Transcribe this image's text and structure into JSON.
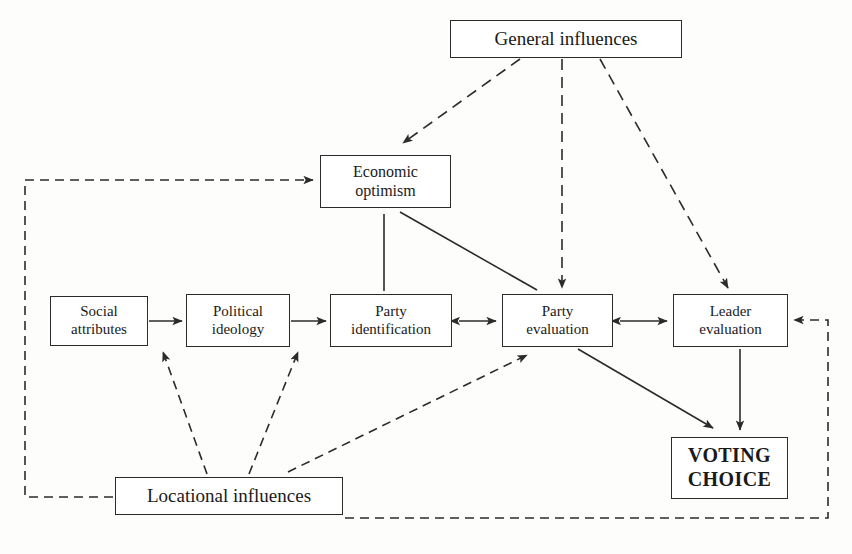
{
  "diagram": {
    "nodes": {
      "general_influences": {
        "label": "General influences",
        "lines": [
          "General influences"
        ]
      },
      "economic_optimism": {
        "label": "Economic optimism",
        "lines": [
          "Economic",
          "optimism"
        ]
      },
      "social_attributes": {
        "label": "Social attributes",
        "lines": [
          "Social",
          "attributes"
        ]
      },
      "political_ideology": {
        "label": "Political ideology",
        "lines": [
          "Political",
          "ideology"
        ]
      },
      "party_identification": {
        "label": "Party identification",
        "lines": [
          "Party",
          "identification"
        ]
      },
      "party_evaluation": {
        "label": "Party evaluation",
        "lines": [
          "Party",
          "evaluation"
        ]
      },
      "leader_evaluation": {
        "label": "Leader evaluation",
        "lines": [
          "Leader",
          "evaluation"
        ]
      },
      "voting_choice": {
        "label": "VOTING CHOICE",
        "lines": [
          "VOTING",
          "CHOICE"
        ]
      },
      "locational_influences": {
        "label": "Locational influences",
        "lines": [
          "Locational influences"
        ]
      }
    },
    "edges": [
      {
        "id": "gen-to-econ",
        "from": "general_influences",
        "to": "economic_optimism",
        "style": "dashed",
        "arrows": "single"
      },
      {
        "id": "gen-to-partyeval",
        "from": "general_influences",
        "to": "party_evaluation",
        "style": "dashed",
        "arrows": "single"
      },
      {
        "id": "gen-to-leadereval",
        "from": "general_influences",
        "to": "leader_evaluation",
        "style": "dashed",
        "arrows": "single"
      },
      {
        "id": "econ-to-partyeval",
        "from": "economic_optimism",
        "to": "party_evaluation",
        "style": "solid",
        "arrows": "single"
      },
      {
        "id": "partyid-to-econ",
        "from": "party_identification",
        "to": "economic_optimism",
        "style": "solid",
        "arrows": "single"
      },
      {
        "id": "social-to-ideology",
        "from": "social_attributes",
        "to": "political_ideology",
        "style": "solid",
        "arrows": "single"
      },
      {
        "id": "ideology-to-partyid",
        "from": "political_ideology",
        "to": "party_identification",
        "style": "solid",
        "arrows": "single"
      },
      {
        "id": "partyid-partyeval",
        "from": "party_identification",
        "to": "party_evaluation",
        "style": "solid",
        "arrows": "double"
      },
      {
        "id": "partyeval-leadereval",
        "from": "party_evaluation",
        "to": "leader_evaluation",
        "style": "solid",
        "arrows": "double"
      },
      {
        "id": "partyeval-to-voting",
        "from": "party_evaluation",
        "to": "voting_choice",
        "style": "solid",
        "arrows": "single"
      },
      {
        "id": "leadereval-to-voting",
        "from": "leader_evaluation",
        "to": "voting_choice",
        "style": "solid",
        "arrows": "single"
      },
      {
        "id": "loc-to-social",
        "from": "locational_influences",
        "to": "social_attributes",
        "style": "dashed",
        "arrows": "single"
      },
      {
        "id": "loc-to-partyid",
        "from": "locational_influences",
        "to": "party_identification",
        "style": "dashed",
        "arrows": "single"
      },
      {
        "id": "loc-to-partyeval",
        "from": "locational_influences",
        "to": "party_evaluation",
        "style": "dashed",
        "arrows": "single"
      },
      {
        "id": "loc-to-econ",
        "from": "locational_influences",
        "to": "economic_optimism",
        "style": "dashed",
        "arrows": "single",
        "routing": "left-side"
      },
      {
        "id": "loc-to-leadereval",
        "from": "locational_influences",
        "to": "leader_evaluation",
        "style": "dashed",
        "arrows": "single",
        "routing": "right-side"
      }
    ],
    "colors": {
      "stroke": "#2b2b2b",
      "background": "#fdfdfb",
      "box_fill": "#ffffff",
      "text": "#1a1a1a"
    }
  }
}
